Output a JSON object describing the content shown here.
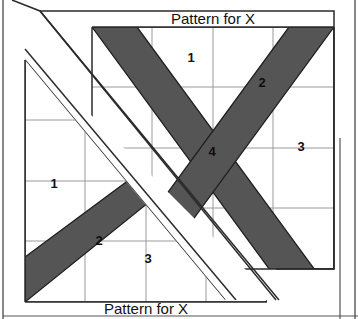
{
  "figure": {
    "title_top": "Pattern for X",
    "title_bottom": "Pattern for X",
    "colors": {
      "background": "#ffffff",
      "panel_fill": "#ffffff",
      "band_fill": "#555555",
      "outline": "#2b2b2b",
      "grid": "#9a9a9a",
      "frame": "#555555",
      "text": "#111111"
    },
    "back_panel": {
      "name": "Pattern for X",
      "label": "Pattern for X",
      "regions": [
        {
          "id": "r1",
          "label": "1",
          "type": "light",
          "x": 191,
          "y": 62
        },
        {
          "id": "r2",
          "label": "2",
          "type": "dark",
          "x": 262,
          "y": 87
        },
        {
          "id": "r4",
          "label": "4",
          "type": "dark",
          "x": 212,
          "y": 151
        },
        {
          "id": "r3",
          "label": "3",
          "type": "light",
          "x": 301,
          "y": 146
        }
      ]
    },
    "front_panel": {
      "name": "Pattern for X",
      "label": "Pattern for X",
      "regions": [
        {
          "id": "f1",
          "label": "1",
          "type": "light",
          "x": 54,
          "y": 183
        },
        {
          "id": "f2",
          "label": "2",
          "type": "dark",
          "x": 99,
          "y": 240
        },
        {
          "id": "f3",
          "label": "3",
          "type": "light",
          "x": 146,
          "y": 258
        }
      ]
    },
    "grid": {
      "back_columns": 4,
      "back_rows": 4,
      "front_columns": 4,
      "front_rows": 4
    }
  }
}
